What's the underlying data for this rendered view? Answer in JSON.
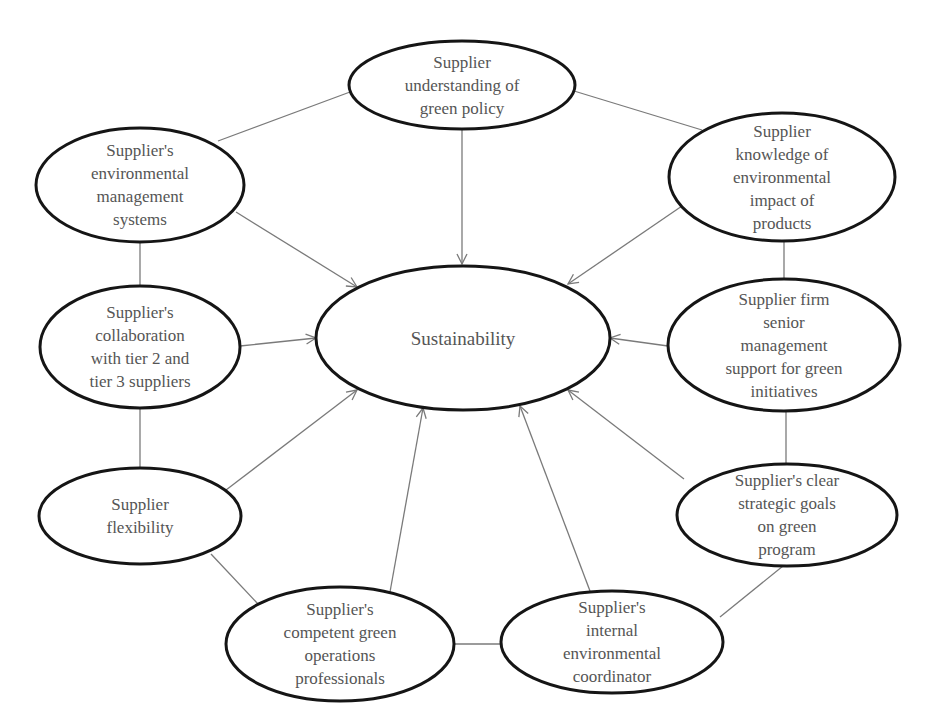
{
  "diagram": {
    "type": "hub-and-spoke concept map",
    "center": {
      "id": "sustainability",
      "label": "Sustainability",
      "cx": 463,
      "cy": 338,
      "rx": 147,
      "ry": 72
    },
    "nodes": [
      {
        "id": "green-policy",
        "label": "Supplier\nunderstanding of\ngreen policy",
        "cx": 462,
        "cy": 85,
        "rx": 113,
        "ry": 44
      },
      {
        "id": "env-mgmt-systems",
        "label": "Supplier's\nenvironmental\nmanagement\nsystems",
        "cx": 140,
        "cy": 185,
        "rx": 104,
        "ry": 57
      },
      {
        "id": "env-impact-knowledge",
        "label": "Supplier\nknowledge of\nenvironmental\nimpact of\nproducts",
        "cx": 782,
        "cy": 177,
        "rx": 113,
        "ry": 64
      },
      {
        "id": "tier-collaboration",
        "label": "Supplier's\ncollaboration\nwith tier 2 and\ntier 3 suppliers",
        "cx": 140,
        "cy": 347,
        "rx": 100,
        "ry": 61
      },
      {
        "id": "senior-mgmt-support",
        "label": "Supplier firm\nsenior\nmanagement\nsupport for green\ninitiatives",
        "cx": 784,
        "cy": 345,
        "rx": 116,
        "ry": 66
      },
      {
        "id": "flexibility",
        "label": "Supplier\nflexibility",
        "cx": 140,
        "cy": 516,
        "rx": 101,
        "ry": 48
      },
      {
        "id": "strategic-goals",
        "label": "Supplier's clear\nstrategic goals\non green\nprogram",
        "cx": 787,
        "cy": 515,
        "rx": 110,
        "ry": 51
      },
      {
        "id": "green-professionals",
        "label": "Supplier's\ncompetent green\noperations\nprofessionals",
        "cx": 340,
        "cy": 644,
        "rx": 114,
        "ry": 57
      },
      {
        "id": "env-coordinator",
        "label": "Supplier's\ninternal\nenvironmental\ncoordinator",
        "cx": 612,
        "cy": 642,
        "rx": 111,
        "ry": 51
      }
    ],
    "arrows_to_center": [
      {
        "from": "green-policy",
        "x1": 462,
        "y1": 130,
        "x2": 462,
        "y2": 264
      },
      {
        "from": "env-mgmt-systems",
        "x1": 236,
        "y1": 212,
        "x2": 357,
        "y2": 287
      },
      {
        "from": "env-impact-knowledge",
        "x1": 682,
        "y1": 206,
        "x2": 568,
        "y2": 284
      },
      {
        "from": "tier-collaboration",
        "x1": 240,
        "y1": 346,
        "x2": 316,
        "y2": 338
      },
      {
        "from": "senior-mgmt-support",
        "x1": 668,
        "y1": 346,
        "x2": 610,
        "y2": 338
      },
      {
        "from": "flexibility",
        "x1": 226,
        "y1": 490,
        "x2": 357,
        "y2": 390
      },
      {
        "from": "strategic-goals",
        "x1": 684,
        "y1": 479,
        "x2": 568,
        "y2": 390
      },
      {
        "from": "green-professionals",
        "x1": 390,
        "y1": 592,
        "x2": 423,
        "y2": 408
      },
      {
        "from": "env-coordinator",
        "x1": 590,
        "y1": 591,
        "x2": 520,
        "y2": 406
      }
    ],
    "ring_links": [
      {
        "from": "env-mgmt-systems",
        "to": "green-policy",
        "x1": 218,
        "y1": 141,
        "x2": 350,
        "y2": 92
      },
      {
        "from": "green-policy",
        "to": "env-impact-knowledge",
        "x1": 574,
        "y1": 91,
        "x2": 702,
        "y2": 130
      },
      {
        "from": "env-impact-knowledge",
        "to": "senior-mgmt-support",
        "x1": 784,
        "y1": 241,
        "x2": 784,
        "y2": 279
      },
      {
        "from": "senior-mgmt-support",
        "to": "strategic-goals",
        "x1": 786,
        "y1": 411,
        "x2": 786,
        "y2": 464
      },
      {
        "from": "strategic-goals",
        "to": "env-coordinator",
        "x1": 783,
        "y1": 566,
        "x2": 720,
        "y2": 617
      },
      {
        "from": "env-coordinator",
        "to": "green-professionals",
        "x1": 501,
        "y1": 644,
        "x2": 455,
        "y2": 644
      },
      {
        "from": "green-professionals",
        "to": "flexibility",
        "x1": 258,
        "y1": 604,
        "x2": 211,
        "y2": 554
      },
      {
        "from": "flexibility",
        "to": "tier-collaboration",
        "x1": 140,
        "y1": 468,
        "x2": 140,
        "y2": 408
      },
      {
        "from": "tier-collaboration",
        "to": "env-mgmt-systems",
        "x1": 140,
        "y1": 286,
        "x2": 140,
        "y2": 242
      }
    ],
    "colors": {
      "node_stroke": "#151515",
      "edge": "#7a7a7a",
      "text": "#555555",
      "background": "#ffffff"
    }
  }
}
